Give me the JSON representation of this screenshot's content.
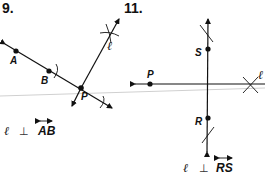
{
  "problems": [
    {
      "number": "9.",
      "points": [
        "A",
        "B",
        "P"
      ],
      "line_label": "ℓ",
      "statement": {
        "left": "ℓ",
        "symbol": "⊥",
        "right": "AB"
      }
    },
    {
      "number": "11.",
      "points": [
        "S",
        "P",
        "R"
      ],
      "line_label": "ℓ",
      "statement": {
        "left": "ℓ",
        "symbol": "⊥",
        "right": "RS"
      }
    }
  ]
}
